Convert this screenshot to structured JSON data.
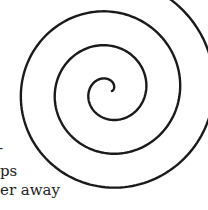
{
  "figure": {
    "type": "archimedean-spiral",
    "stroke_color": "#1a1a1a",
    "stroke_width": 2.4,
    "center": [
      109,
      91
    ],
    "start_radius": 3,
    "spacing_per_turn": 34,
    "turns": 3.3,
    "start_angle_deg": 0
  },
  "text_fragments": [
    {
      "text": "-",
      "x": -2,
      "y": 147
    },
    {
      "text": "ps",
      "x": 0,
      "y": 173
    },
    {
      "text": "er away",
      "x": 0,
      "y": 192
    }
  ]
}
